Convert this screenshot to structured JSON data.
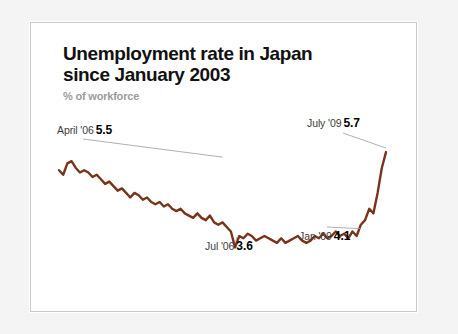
{
  "card": {
    "title": "Unemployment rate in Japan\nsince January 2003",
    "subtitle": "% of workforce"
  },
  "chart_data": {
    "type": "line",
    "title": "Unemployment rate in Japan since January 2003",
    "subtitle": "% of workforce",
    "xlabel": "",
    "ylabel": "% of workforce",
    "ylim": [
      3.3,
      5.9
    ],
    "xlim": [
      "2003-01",
      "2009-07"
    ],
    "grid": false,
    "legend": null,
    "line_color": "#7a3318",
    "annotations": [
      {
        "id": "april06",
        "label": "April '06",
        "value": "5.5",
        "x": "2006-04",
        "y": 5.5
      },
      {
        "id": "july09",
        "label": "July '09",
        "value": "5.7",
        "x": "2009-07",
        "y": 5.7
      },
      {
        "id": "jul06",
        "label": "Jul '06",
        "value": "3.6",
        "x": "2006-07",
        "y": 3.6
      },
      {
        "id": "jan09",
        "label": "Jan '09",
        "value": "4.1",
        "x": "2009-01",
        "y": 4.1
      }
    ],
    "x": [
      "2003-01",
      "2003-02",
      "2003-03",
      "2003-04",
      "2003-05",
      "2003-06",
      "2003-07",
      "2003-08",
      "2003-09",
      "2003-10",
      "2003-11",
      "2003-12",
      "2004-01",
      "2004-02",
      "2004-03",
      "2004-04",
      "2004-05",
      "2004-06",
      "2004-07",
      "2004-08",
      "2004-09",
      "2004-10",
      "2004-11",
      "2004-12",
      "2005-01",
      "2005-02",
      "2005-03",
      "2005-04",
      "2005-05",
      "2005-06",
      "2005-07",
      "2005-08",
      "2005-09",
      "2005-10",
      "2005-11",
      "2005-12",
      "2006-01",
      "2006-02",
      "2006-03",
      "2006-04",
      "2006-05",
      "2006-06",
      "2006-07",
      "2006-08",
      "2006-09",
      "2006-10",
      "2006-11",
      "2006-12",
      "2007-01",
      "2007-02",
      "2007-03",
      "2007-04",
      "2007-05",
      "2007-06",
      "2007-07",
      "2007-08",
      "2007-09",
      "2007-10",
      "2007-11",
      "2007-12",
      "2008-01",
      "2008-02",
      "2008-03",
      "2008-04",
      "2008-05",
      "2008-06",
      "2008-07",
      "2008-08",
      "2008-09",
      "2008-10",
      "2008-11",
      "2008-12",
      "2009-01",
      "2009-02",
      "2009-03",
      "2009-04",
      "2009-05",
      "2009-06",
      "2009-07"
    ],
    "values": [
      5.3,
      5.2,
      5.45,
      5.5,
      5.35,
      5.25,
      5.3,
      5.25,
      5.15,
      5.2,
      5.1,
      5.0,
      5.05,
      4.95,
      4.85,
      4.9,
      4.8,
      4.7,
      4.8,
      4.75,
      4.65,
      4.7,
      4.6,
      4.55,
      4.6,
      4.5,
      4.55,
      4.45,
      4.4,
      4.45,
      4.35,
      4.3,
      4.25,
      4.35,
      4.25,
      4.2,
      4.3,
      4.15,
      4.1,
      4.15,
      4.05,
      3.95,
      3.6,
      3.85,
      3.8,
      3.9,
      3.85,
      3.75,
      3.8,
      3.85,
      3.8,
      3.75,
      3.7,
      3.8,
      3.7,
      3.75,
      3.8,
      3.85,
      3.75,
      3.7,
      3.75,
      3.85,
      3.8,
      3.9,
      3.8,
      3.85,
      3.95,
      3.85,
      3.9,
      3.8,
      3.95,
      3.85,
      4.1,
      4.2,
      4.45,
      4.35,
      4.8,
      5.35,
      5.7
    ]
  }
}
